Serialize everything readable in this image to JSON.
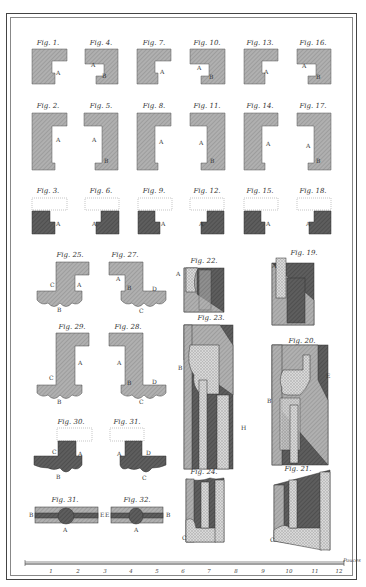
{
  "plate": {
    "colors": {
      "light_hatch": "#a8a8a8",
      "dark_hatch": "#5a5a5a",
      "mid_hatch": "#888888",
      "paper": "#ffffff",
      "line": "#333333"
    },
    "figures": {
      "fig1": {
        "caption": "Fig. 1.",
        "labels": [
          "A"
        ]
      },
      "fig4": {
        "caption": "Fig. 4.",
        "labels": [
          "A",
          "B"
        ]
      },
      "fig7": {
        "caption": "Fig. 7.",
        "labels": [
          "A"
        ]
      },
      "fig10": {
        "caption": "Fig. 10.",
        "labels": [
          "A",
          "B"
        ]
      },
      "fig13": {
        "caption": "Fig. 13.",
        "labels": [
          "A"
        ]
      },
      "fig16": {
        "caption": "Fig. 16.",
        "labels": [
          "A",
          "B"
        ]
      },
      "fig2": {
        "caption": "Fig. 2.",
        "labels": [
          "A"
        ]
      },
      "fig5": {
        "caption": "Fig. 5.",
        "labels": [
          "A",
          "B"
        ]
      },
      "fig8": {
        "caption": "Fig. 8.",
        "labels": [
          "A"
        ]
      },
      "fig11": {
        "caption": "Fig. 11.",
        "labels": [
          "A",
          "B"
        ]
      },
      "fig14": {
        "caption": "Fig. 14.",
        "labels": [
          "A"
        ]
      },
      "fig17": {
        "caption": "Fig. 17.",
        "labels": [
          "A",
          "B"
        ]
      },
      "fig3": {
        "caption": "Fig. 3.",
        "labels": [
          "A"
        ]
      },
      "fig6": {
        "caption": "Fig. 6.",
        "labels": [
          "A"
        ]
      },
      "fig9": {
        "caption": "Fig. 9.",
        "labels": [
          "A"
        ]
      },
      "fig12": {
        "caption": "Fig. 12.",
        "labels": [
          "A"
        ]
      },
      "fig15": {
        "caption": "Fig. 15.",
        "labels": [
          "A"
        ]
      },
      "fig18": {
        "caption": "Fig. 18.",
        "labels": [
          "A"
        ]
      },
      "fig25": {
        "caption": "Fig. 25.",
        "labels": [
          "C",
          "A",
          "B"
        ]
      },
      "fig27": {
        "caption": "Fig. 27.",
        "labels": [
          "A",
          "B",
          "D",
          "C"
        ]
      },
      "fig22": {
        "caption": "Fig. 22.",
        "labels": [
          "A",
          "F"
        ]
      },
      "fig19": {
        "caption": "Fig. 19.",
        "labels": [
          "A",
          "E"
        ]
      },
      "fig29": {
        "caption": "Fig. 29.",
        "labels": [
          "A",
          "C",
          "B"
        ]
      },
      "fig28": {
        "caption": "Fig. 28.",
        "labels": [
          "A",
          "B",
          "D",
          "C"
        ]
      },
      "fig23": {
        "caption": "Fig. 23.",
        "labels": [
          "B",
          "F",
          "G",
          "H"
        ]
      },
      "fig20": {
        "caption": "Fig. 20.",
        "labels": [
          "D",
          "F",
          "E",
          "B",
          "G"
        ]
      },
      "fig30": {
        "caption": "Fig. 30.",
        "labels": [
          "C",
          "A",
          "B"
        ]
      },
      "fig31_b": {
        "caption": "Fig. 31.",
        "labels": [
          "A",
          "D",
          "C"
        ]
      },
      "fig24": {
        "caption": "Fig. 24.",
        "labels": [
          "G",
          "H",
          "C"
        ]
      },
      "fig21": {
        "caption": "Fig. 21.",
        "labels": [
          "G",
          "H",
          "C"
        ]
      },
      "fig31": {
        "caption": "Fig. 31.",
        "labels": [
          "B",
          "E",
          "A"
        ]
      },
      "fig32": {
        "caption": "Fig. 32.",
        "labels": [
          "E",
          "B",
          "A"
        ]
      }
    },
    "scale": {
      "ticks": [
        "1",
        "2",
        "3",
        "4",
        "5",
        "6",
        "7",
        "8",
        "9",
        "10",
        "11",
        "12"
      ],
      "unit_label": "Pouces"
    }
  }
}
